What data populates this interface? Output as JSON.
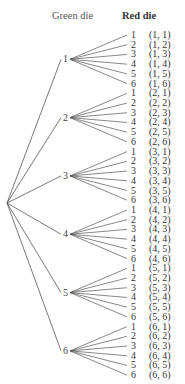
{
  "headers": {
    "green": "Green die",
    "red": "Red die"
  },
  "green_die": [
    {
      "label": "1",
      "red": [
        "1",
        "2",
        "3",
        "4",
        "5",
        "6"
      ],
      "pairs": [
        "(1, 1)",
        "(1, 2)",
        "(1, 3)",
        "(1, 4)",
        "(1, 5)",
        "(1, 6)"
      ]
    },
    {
      "label": "2",
      "red": [
        "1",
        "2",
        "3",
        "4",
        "5",
        "6"
      ],
      "pairs": [
        "(2, 1)",
        "(2, 2)",
        "(2, 3)",
        "(2, 4)",
        "(2, 5)",
        "(2, 6)"
      ]
    },
    {
      "label": "3",
      "red": [
        "1",
        "2",
        "3",
        "4",
        "5",
        "6"
      ],
      "pairs": [
        "(3, 1)",
        "(3, 2)",
        "(3, 3)",
        "(3, 4)",
        "(3, 5)",
        "(3, 6)"
      ]
    },
    {
      "label": "4",
      "red": [
        "1",
        "2",
        "3",
        "4",
        "5",
        "6"
      ],
      "pairs": [
        "(4, 1)",
        "(4, 2)",
        "(4, 3)",
        "(4, 4)",
        "(4, 5)",
        "(4, 6)"
      ]
    },
    {
      "label": "5",
      "red": [
        "1",
        "2",
        "3",
        "4",
        "5",
        "6"
      ],
      "pairs": [
        "(5, 1)",
        "(5, 2)",
        "(5, 3)",
        "(5, 4)",
        "(5, 5)",
        "(5, 6)"
      ]
    },
    {
      "label": "6",
      "red": [
        "1",
        "2",
        "3",
        "4",
        "5",
        "6"
      ],
      "pairs": [
        "(6, 1)",
        "(6, 2)",
        "(6, 3)",
        "(6, 4)",
        "(6, 5)",
        "(6, 6)"
      ]
    }
  ],
  "colors": {
    "line": "#555555",
    "text": "#3a3a3a"
  }
}
